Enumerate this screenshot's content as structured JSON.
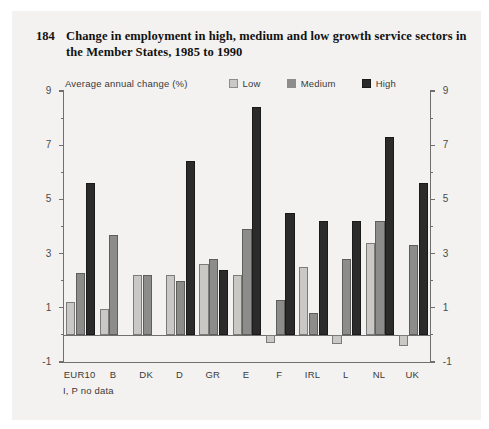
{
  "figure": {
    "number": "184",
    "title": "Change in employment in high, medium and low growth service sectors in the Member States, 1985 to 1990",
    "footnote": "I, P no data"
  },
  "legend": {
    "axis_note": "Average annual change (%)",
    "items": [
      {
        "label": "Low",
        "color": "#c9c8c4"
      },
      {
        "label": "Medium",
        "color": "#8c8c8a"
      },
      {
        "label": "High",
        "color": "#2b2b2b"
      }
    ]
  },
  "axis": {
    "y_major_ticks": [
      "9",
      "7",
      "5",
      "3",
      "1",
      "-1"
    ],
    "y_minor_ticks": [
      "8",
      "6",
      "4",
      "2",
      "0"
    ]
  },
  "chart_data": {
    "type": "bar",
    "title": "Change in employment in high, medium and low growth service sectors in the Member States, 1985 to 1990",
    "xlabel": "",
    "ylabel": "Average annual change (%)",
    "ylim": [
      -1,
      9
    ],
    "ytick_step": 2,
    "yminor_step": 1,
    "grid": false,
    "legend_position": "top",
    "categories": [
      "EUR10",
      "B",
      "DK",
      "D",
      "GR",
      "E",
      "F",
      "IRL",
      "L",
      "NL",
      "UK"
    ],
    "series": [
      {
        "name": "Low",
        "color": "#c9c8c4",
        "values": [
          1.2,
          0.95,
          2.2,
          2.2,
          2.6,
          2.2,
          -0.3,
          2.5,
          -0.35,
          3.4,
          -0.4
        ]
      },
      {
        "name": "Medium",
        "color": "#8c8c8a",
        "values": [
          2.3,
          3.7,
          2.2,
          2.0,
          2.8,
          3.9,
          1.3,
          0.8,
          2.8,
          4.2,
          3.3
        ]
      },
      {
        "name": "High",
        "color": "#2b2b2b",
        "values": [
          5.6,
          null,
          null,
          6.4,
          2.4,
          8.4,
          4.5,
          4.2,
          4.2,
          7.3,
          5.6
        ]
      }
    ],
    "notes": "I, P no data"
  }
}
